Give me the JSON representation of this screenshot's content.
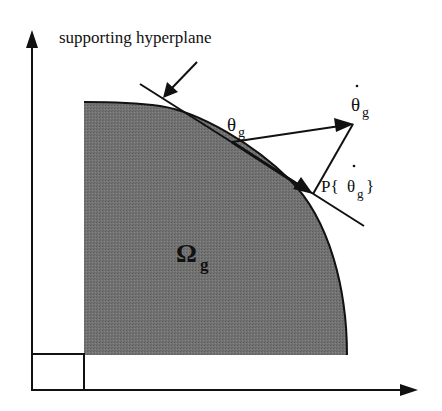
{
  "diagram": {
    "title_label": "supporting hyperplane",
    "region_label": "Ω",
    "region_subscript": "g",
    "theta_label": "θ",
    "theta_subscript": "g",
    "theta_dot_label": "θ",
    "theta_dot_subscript": "g",
    "projection_label_prefix": "P{",
    "projection_theta": "θ",
    "projection_subscript": "g",
    "projection_label_suffix": "}",
    "colors": {
      "region_fill": "#6f6f6f",
      "stroke": "#111111",
      "background": "#ffffff"
    }
  }
}
